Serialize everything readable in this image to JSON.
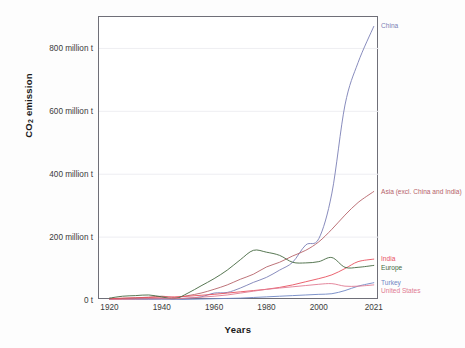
{
  "chart_data": {
    "type": "line",
    "title": "",
    "xlabel": "Years",
    "ylabel": "CO2 emission",
    "ylabel_html": "CO<sub>2</sub> emission",
    "xlim": [
      1916,
      2023
    ],
    "ylim": [
      0,
      900
    ],
    "yunit": "million t",
    "grid": "horizontal-faint",
    "legend_position": "inline-right-end-of-line",
    "xticks": [
      1920,
      1940,
      1960,
      1980,
      2000,
      2021
    ],
    "xtick_labels": [
      "1920",
      "1940",
      "1960",
      "1980",
      "2000",
      "2021"
    ],
    "yticks": [
      0,
      200,
      400,
      600,
      800
    ],
    "ytick_labels": [
      "0 t",
      "200 million t",
      "400 million t",
      "600 million t",
      "800 million t"
    ],
    "x": [
      1920,
      1925,
      1930,
      1935,
      1940,
      1945,
      1950,
      1955,
      1960,
      1965,
      1970,
      1975,
      1980,
      1985,
      1990,
      1995,
      2000,
      2005,
      2010,
      2015,
      2021
    ],
    "series": [
      {
        "name": "China",
        "label": "China",
        "color": "#7b7fb5",
        "end_value": 870,
        "values": [
          2,
          3,
          4,
          4,
          5,
          4,
          6,
          10,
          22,
          24,
          38,
          56,
          72,
          95,
          120,
          175,
          195,
          340,
          620,
          755,
          870
        ]
      },
      {
        "name": "Asia (excl. China and India)",
        "label": "Asia (excl. China and India)",
        "color": "#b5636a",
        "end_value": 345,
        "values": [
          3,
          5,
          7,
          9,
          12,
          8,
          14,
          22,
          34,
          48,
          66,
          82,
          105,
          120,
          140,
          158,
          185,
          225,
          270,
          310,
          345
        ]
      },
      {
        "name": "India",
        "label": "India",
        "color": "#e8515f",
        "end_value": 130,
        "values": [
          4,
          6,
          7,
          8,
          9,
          10,
          12,
          15,
          18,
          22,
          26,
          30,
          34,
          40,
          48,
          58,
          68,
          80,
          100,
          122,
          130
        ]
      },
      {
        "name": "Europe",
        "label": "Europe",
        "color": "#44683f",
        "end_value": 110,
        "values": [
          6,
          12,
          14,
          16,
          10,
          4,
          22,
          45,
          68,
          95,
          128,
          158,
          152,
          142,
          120,
          118,
          122,
          135,
          104,
          104,
          110
        ]
      },
      {
        "name": "Turkey",
        "label": "Turkey",
        "color": "#6f87c4",
        "end_value": 55,
        "values": [
          0,
          0,
          1,
          1,
          1,
          1,
          2,
          3,
          4,
          5,
          6,
          8,
          10,
          12,
          14,
          16,
          18,
          20,
          30,
          44,
          55
        ]
      },
      {
        "name": "United States",
        "label": "United States",
        "color": "#e07b92",
        "end_value": 48,
        "values": [
          1,
          2,
          3,
          4,
          4,
          4,
          6,
          9,
          12,
          16,
          22,
          28,
          34,
          38,
          42,
          46,
          50,
          52,
          44,
          44,
          48
        ]
      }
    ]
  }
}
